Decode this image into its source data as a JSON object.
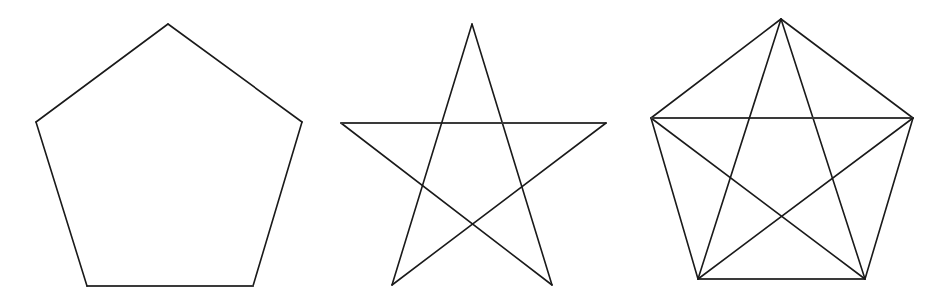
{
  "document": {
    "title": "Pentagon, Pentagram and Complete Graph K5",
    "background_color": "#ffffff",
    "stroke_color": "#1a1a1a",
    "horizontal_stroke_color": "#3a3a3a",
    "stroke_width": 1.6,
    "width": 944,
    "height": 302
  },
  "figures": [
    {
      "id": "pentagon",
      "name": "pentagon",
      "description": "Regular convex pentagon, 5 vertices joined by 5 edges in cyclic order",
      "vertex_count": 5,
      "edge_count": 5,
      "vertices": [
        {
          "label": "A",
          "x": 168,
          "y": 24
        },
        {
          "label": "B",
          "x": 302,
          "y": 122
        },
        {
          "label": "C",
          "x": 253,
          "y": 286
        },
        {
          "label": "D",
          "x": 87,
          "y": 286
        },
        {
          "label": "E",
          "x": 36,
          "y": 122
        }
      ],
      "edges": [
        {
          "from": 0,
          "to": 1,
          "kind": "side"
        },
        {
          "from": 1,
          "to": 2,
          "kind": "side"
        },
        {
          "from": 2,
          "to": 3,
          "kind": "side",
          "orientation": "horizontal"
        },
        {
          "from": 3,
          "to": 4,
          "kind": "side"
        },
        {
          "from": 4,
          "to": 0,
          "kind": "side"
        }
      ]
    },
    {
      "id": "pentagram",
      "name": "pentagram",
      "description": "Five-pointed star polygon {5/2}, 5 vertices each joined to the two non-adjacent vertices",
      "vertex_count": 5,
      "edge_count": 5,
      "vertices": [
        {
          "label": "A",
          "x": 472,
          "y": 24
        },
        {
          "label": "B",
          "x": 606,
          "y": 123
        },
        {
          "label": "C",
          "x": 552,
          "y": 285
        },
        {
          "label": "D",
          "x": 392,
          "y": 285
        },
        {
          "label": "E",
          "x": 341,
          "y": 123
        }
      ],
      "edges": [
        {
          "from": 0,
          "to": 2,
          "kind": "diagonal"
        },
        {
          "from": 2,
          "to": 4,
          "kind": "diagonal"
        },
        {
          "from": 4,
          "to": 1,
          "kind": "diagonal",
          "orientation": "horizontal"
        },
        {
          "from": 1,
          "to": 3,
          "kind": "diagonal"
        },
        {
          "from": 3,
          "to": 0,
          "kind": "diagonal"
        }
      ]
    },
    {
      "id": "complete-graph-k5",
      "name": "complete-graph-k5",
      "description": "Complete graph K5: pentagon sides plus all five diagonals, every vertex joined to every other vertex",
      "vertex_count": 5,
      "edge_count": 10,
      "vertices": [
        {
          "label": "A",
          "x": 781,
          "y": 19
        },
        {
          "label": "B",
          "x": 913,
          "y": 118
        },
        {
          "label": "C",
          "x": 865,
          "y": 279
        },
        {
          "label": "D",
          "x": 698,
          "y": 279
        },
        {
          "label": "E",
          "x": 651,
          "y": 118
        }
      ],
      "edges": [
        {
          "from": 0,
          "to": 1,
          "kind": "side"
        },
        {
          "from": 1,
          "to": 2,
          "kind": "side"
        },
        {
          "from": 2,
          "to": 3,
          "kind": "side",
          "orientation": "horizontal"
        },
        {
          "from": 3,
          "to": 4,
          "kind": "side"
        },
        {
          "from": 4,
          "to": 0,
          "kind": "side"
        },
        {
          "from": 0,
          "to": 2,
          "kind": "diagonal"
        },
        {
          "from": 2,
          "to": 4,
          "kind": "diagonal"
        },
        {
          "from": 4,
          "to": 1,
          "kind": "diagonal",
          "orientation": "horizontal"
        },
        {
          "from": 1,
          "to": 3,
          "kind": "diagonal"
        },
        {
          "from": 3,
          "to": 0,
          "kind": "diagonal"
        }
      ]
    }
  ]
}
